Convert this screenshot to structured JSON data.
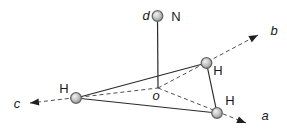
{
  "diagram": {
    "type": "molecular-geometry-diagram",
    "colors": {
      "background": "#ffffff",
      "solid_line": "#2b2b2b",
      "dashed_line": "#4f4f4f",
      "atom_fill": "#c4c4c4",
      "atom_highlight": "#efefef",
      "atom_stroke": "#666666"
    },
    "atoms": [
      {
        "id": "nitrogen",
        "label": "N"
      },
      {
        "id": "hydrogen-left",
        "label": "H"
      },
      {
        "id": "hydrogen-upper-right",
        "label": "H"
      },
      {
        "id": "hydrogen-lower-right",
        "label": "H"
      }
    ],
    "axes": [
      {
        "id": "a",
        "label": "a",
        "style": "dashed-arrow"
      },
      {
        "id": "b",
        "label": "b",
        "style": "dashed-arrow"
      },
      {
        "id": "c",
        "label": "c",
        "style": "dashed-arrow"
      },
      {
        "id": "d",
        "label": "d",
        "style": "solid-line"
      }
    ],
    "origin": {
      "label": "o"
    }
  }
}
